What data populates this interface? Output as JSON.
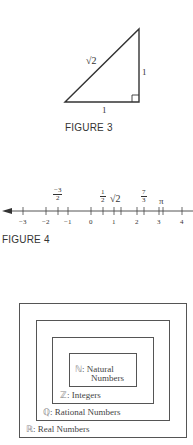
{
  "figure3": {
    "caption": "FIGURE 3",
    "hypotenuse_label": "√2",
    "vertical_side_label": "1",
    "base_label": "1",
    "right_angle_marker": true
  },
  "figure4": {
    "caption": "FIGURE 4",
    "tick_labels": [
      "−3",
      "−2",
      "−1",
      "0",
      "1",
      "2",
      "3",
      "4"
    ],
    "points": [
      {
        "label_num": "−3",
        "label_den": "2",
        "value": -1.5
      },
      {
        "label_num": "1",
        "label_den": "2",
        "value": 0.5
      },
      {
        "label": "√2",
        "value": 1.414
      },
      {
        "label_num": "7",
        "label_den": "3",
        "value": 2.333
      },
      {
        "label": "π",
        "value": 3.1416
      }
    ]
  },
  "sets_diagram": {
    "natural": {
      "symbol": "ℕ",
      "line1": ": Natural",
      "line2": "Numbers"
    },
    "integers": {
      "symbol": "ℤ",
      "text": ": Integers"
    },
    "rational": {
      "symbol": "ℚ",
      "text": ": Rational Numbers"
    },
    "real": {
      "symbol": "ℝ",
      "text": ": Real Numbers"
    }
  }
}
